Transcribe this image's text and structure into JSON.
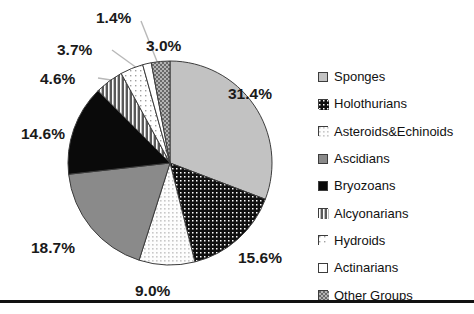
{
  "chart_data": {
    "type": "pie",
    "title": "",
    "subtitle": "",
    "xlabel": "",
    "ylabel": "",
    "legend_position": "right",
    "grid": false,
    "units": "percent",
    "categories": [
      "Sponges",
      "Holothurians",
      "Asteroids&Echinoids",
      "Ascidians",
      "Bryozoans",
      "Alcyonarians",
      "Hydroids",
      "Actinarians",
      "Other Groups"
    ],
    "values": [
      31.4,
      15.6,
      9.0,
      18.7,
      14.6,
      4.6,
      3.7,
      1.4,
      3.0
    ],
    "data_labels": [
      "31.4%",
      "15.6%",
      "9.0%",
      "18.7%",
      "14.6%",
      "4.6%",
      "3.7%",
      "1.4%",
      "3.0%"
    ],
    "slices": [
      {
        "label": "Sponges",
        "value": 31.4,
        "data_label": "31.4%",
        "fill": "#c2c2c2",
        "pattern": "solid",
        "swatch_fill": "#c2c2c2",
        "label_pos": {
          "left": 228,
          "top": 86
        }
      },
      {
        "label": "Holothurians",
        "value": 15.6,
        "data_label": "15.6%",
        "fill": "#101010",
        "pattern": "dots-white-on-black",
        "swatch_fill": "#101010",
        "label_pos": {
          "left": 238,
          "top": 250
        }
      },
      {
        "label": "Asteroids&Echinoids",
        "value": 9.0,
        "data_label": "9.0%",
        "fill": "#fbfbfb",
        "pattern": "dots-gray-on-white",
        "swatch_fill": "#f2f2f2",
        "label_pos": {
          "left": 135,
          "top": 283
        }
      },
      {
        "label": "Ascidians",
        "value": 18.7,
        "data_label": "18.7%",
        "fill": "#8a8a8a",
        "pattern": "solid",
        "swatch_fill": "#8a8a8a",
        "label_pos": {
          "left": 31,
          "top": 240
        }
      },
      {
        "label": "Bryozoans",
        "value": 14.6,
        "data_label": "14.6%",
        "fill": "#0a0a0a",
        "pattern": "solid",
        "swatch_fill": "#0a0a0a",
        "label_pos": {
          "left": 21,
          "top": 126
        }
      },
      {
        "label": "Alcyonarians",
        "value": 4.6,
        "data_label": "4.6%",
        "fill": "#5a5a5a",
        "pattern": "vertical-lines",
        "swatch_fill": "#5a5a5a",
        "label_pos": {
          "left": 40,
          "top": 71
        }
      },
      {
        "label": "Hydroids",
        "value": 3.7,
        "data_label": "3.7%",
        "fill": "#ffffff",
        "pattern": "dots-sparse-gray",
        "swatch_fill": "#ffffff",
        "label_pos": {
          "left": 57,
          "top": 42
        }
      },
      {
        "label": "Actinarians",
        "value": 1.4,
        "data_label": "1.4%",
        "fill": "#ffffff",
        "pattern": "solid",
        "swatch_fill": "#ffffff",
        "label_pos": {
          "left": 96,
          "top": 10
        }
      },
      {
        "label": "Other Groups",
        "value": 3.0,
        "data_label": "3.0%",
        "fill": "#a8a8a8",
        "pattern": "checker-gray",
        "swatch_fill": "#a8a8a8",
        "label_pos": {
          "left": 146,
          "top": 38
        }
      }
    ],
    "geometry": {
      "center_x": 170,
      "center_y": 163,
      "radius": 102,
      "start_angle_deg": 0,
      "direction": "clockwise"
    },
    "leader_lines": [
      {
        "for": "4.6%",
        "from_x": 98,
        "from_y": 78,
        "to_x": 137,
        "to_y": 84
      },
      {
        "for": "3.7%",
        "from_x": 112,
        "from_y": 50,
        "to_x": 148,
        "to_y": 76
      },
      {
        "for": "1.4%",
        "from_x": 141,
        "from_y": 21,
        "to_x": 160,
        "to_y": 69
      }
    ]
  },
  "legend": {
    "items": [
      {
        "label": "Sponges"
      },
      {
        "label": "Holothurians"
      },
      {
        "label": "Asteroids&Echinoids"
      },
      {
        "label": "Ascidians"
      },
      {
        "label": "Bryozoans"
      },
      {
        "label": "Alcyonarians"
      },
      {
        "label": "Hydroids"
      },
      {
        "label": "Actinarians"
      },
      {
        "label": "Other Groups"
      }
    ]
  },
  "colors": {
    "background": "#ffffff",
    "text": "#111111",
    "outline": "#3c3c3c",
    "rule": "#111111"
  }
}
